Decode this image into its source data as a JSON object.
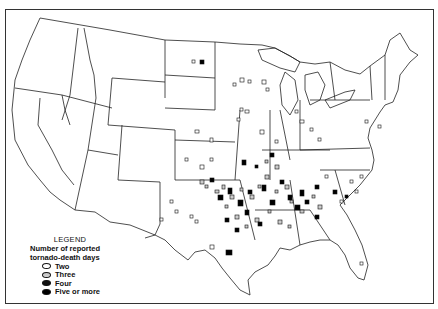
{
  "figure": {
    "type": "US state outline map"
  },
  "legend": {
    "title": "LEGEND",
    "subtitle_line1": "Number of reported",
    "subtitle_line2": "tornado-death days",
    "items": [
      {
        "label": "Two",
        "fill": "#ffffff"
      },
      {
        "label": "Three",
        "fill": "#cccccc"
      },
      {
        "label": "Four",
        "fill": "#111111"
      },
      {
        "label": "Five or more",
        "fill": "#000000"
      }
    ]
  },
  "colors": {
    "outline": "#222222",
    "background": "#ffffff"
  }
}
